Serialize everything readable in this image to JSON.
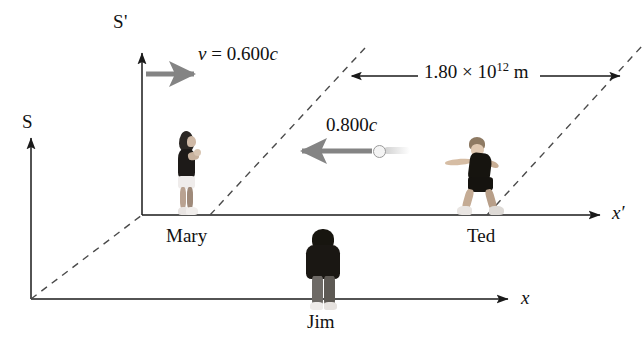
{
  "figure": {
    "frames": {
      "s_label": "S",
      "s_prime_label": "S'"
    },
    "axes": {
      "x_label": "x",
      "x_prime_label": "x'"
    },
    "velocities": {
      "frame_velocity": "v = 0.600c",
      "frame_velocity_symbol": "v",
      "frame_velocity_value": "0.600c",
      "ball_velocity": "0.800c"
    },
    "distance": {
      "mantissa": "1.80",
      "times": "×",
      "base": "10",
      "exponent": "12",
      "unit": "m",
      "full": "1.80 × 10^12 m"
    },
    "people": [
      {
        "name": "Mary",
        "frame": "S'"
      },
      {
        "name": "Ted",
        "frame": "S'"
      },
      {
        "name": "Jim",
        "frame": "S"
      }
    ],
    "person_labels": {
      "mary": "Mary",
      "ted": "Ted",
      "jim": "Jim"
    },
    "colors": {
      "line": "#1a1a1a",
      "dashed": "#4a4a4a",
      "velocity_arrow": "#808080",
      "background": "#ffffff",
      "ball": "#f4f4f4"
    }
  }
}
